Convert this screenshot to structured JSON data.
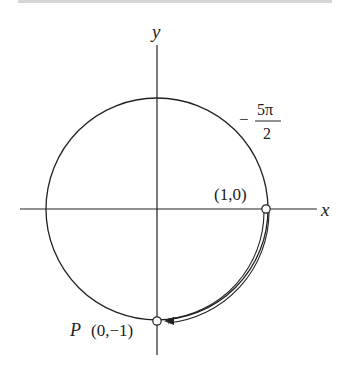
{
  "figure": {
    "axes": {
      "x_label": "x",
      "y_label": "y"
    },
    "points": {
      "start": {
        "label": "(1,0)"
      },
      "end": {
        "label_prefix": "P",
        "label": "(0,−1)"
      }
    },
    "angle": {
      "sign": "−",
      "numerator": "5π",
      "denominator": "2"
    },
    "colors": {
      "stroke": "#222222",
      "background": "#ffffff",
      "top_rule": "#d6d6d6"
    }
  }
}
